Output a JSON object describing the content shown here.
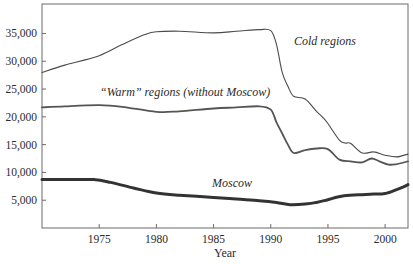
{
  "chart_data": {
    "type": "line",
    "title": "",
    "xlabel": "Year",
    "ylabel": "",
    "xlim": [
      1970,
      2002
    ],
    "ylim": [
      0,
      40300
    ],
    "grid": false,
    "legend": "inline labels",
    "x_ticks": [
      1975,
      1980,
      1985,
      1990,
      1995,
      2000
    ],
    "y_ticks": [
      5000,
      10000,
      15000,
      20000,
      25000,
      30000,
      35000
    ],
    "y_tick_labels": [
      "5,000",
      "10,000",
      "15,000",
      "20,000",
      "25,000",
      "30,000",
      "35,000"
    ],
    "series": [
      {
        "name": "Cold regions",
        "label": "Cold regions",
        "label_pos": [
          294,
          45
        ],
        "color": "#4a4a4a",
        "width": 1.1,
        "x": [
          1970,
          1972,
          1975,
          1977,
          1979,
          1980,
          1982,
          1985,
          1987,
          1989,
          1990,
          1990.5,
          1991,
          1991.5,
          1992,
          1993,
          1994,
          1994.5,
          1995,
          1996,
          1996.5,
          1997,
          1998,
          1999,
          2000,
          2001,
          2002
        ],
        "values": [
          28000,
          29300,
          31000,
          33000,
          34800,
          35300,
          35400,
          35100,
          35400,
          35700,
          35500,
          33000,
          28000,
          25500,
          23700,
          23200,
          21000,
          20000,
          18800,
          15800,
          15300,
          15200,
          13500,
          13700,
          13100,
          12800,
          13300
        ]
      },
      {
        "name": "Warm regions (without Moscow)",
        "label": "“Warm” regions (without Moscow)",
        "label_pos": [
          100,
          96
        ],
        "color": "#555555",
        "width": 1.8,
        "x": [
          1970,
          1972,
          1975,
          1977,
          1980,
          1982,
          1985,
          1987,
          1989,
          1990,
          1990.5,
          1991,
          1991.5,
          1992,
          1993,
          1994,
          1995,
          1996,
          1997,
          1998,
          1998.8,
          1999.5,
          2000.3,
          2001,
          2002
        ],
        "values": [
          21700,
          21900,
          22100,
          21800,
          20900,
          21000,
          21500,
          21700,
          21900,
          21300,
          19000,
          17000,
          15000,
          13500,
          14000,
          14300,
          14200,
          12300,
          12000,
          11800,
          12500,
          12000,
          11400,
          11500,
          12000
        ]
      },
      {
        "name": "Moscow",
        "label": "Moscow",
        "label_pos": [
          212,
          187
        ],
        "color": "#333333",
        "width": 3,
        "x": [
          1970,
          1972,
          1974.5,
          1976,
          1978,
          1980,
          1982,
          1985,
          1987,
          1989,
          1990.5,
          1991.7,
          1993,
          1994,
          1995,
          1996.4,
          1998,
          1999,
          2000,
          2001,
          2001.5,
          2002
        ],
        "values": [
          8700,
          8700,
          8700,
          8200,
          7200,
          6300,
          5900,
          5500,
          5200,
          4900,
          4600,
          4200,
          4300,
          4600,
          5100,
          5800,
          6000,
          6100,
          6200,
          6900,
          7300,
          7800
        ]
      }
    ]
  }
}
